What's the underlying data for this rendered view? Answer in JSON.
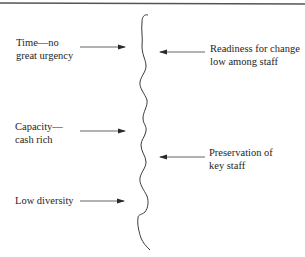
{
  "diagram": {
    "type": "force-field",
    "driving_forces": [
      {
        "id": "time",
        "lines": [
          "Time—no",
          "great urgency"
        ],
        "direction": "right"
      },
      {
        "id": "capacity",
        "lines": [
          "Capacity—",
          "cash rich"
        ],
        "direction": "right"
      },
      {
        "id": "diversity",
        "lines": [
          "Low diversity"
        ],
        "direction": "right"
      }
    ],
    "restraining_forces": [
      {
        "id": "readiness",
        "lines": [
          "Readiness for change",
          "low among staff"
        ],
        "direction": "left"
      },
      {
        "id": "preservation",
        "lines": [
          "Preservation of",
          "key staff"
        ],
        "direction": "left"
      }
    ],
    "colors": {
      "line": "#3a3a3a",
      "rule": "#555555",
      "text": "#1e1e1e"
    }
  }
}
